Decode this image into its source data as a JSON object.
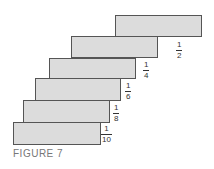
{
  "figure": {
    "caption": "FIGURE 7",
    "blocks": [
      {
        "left": 115,
        "top": 15,
        "width": 87,
        "height": 22,
        "label_num": "1",
        "label_den": "2",
        "label_left": 176,
        "label_top": 41
      },
      {
        "left": 71,
        "top": 36,
        "width": 87,
        "height": 22,
        "label_num": "1",
        "label_den": "4",
        "label_left": 143,
        "label_top": 61
      },
      {
        "left": 49,
        "top": 58,
        "width": 87,
        "height": 21,
        "label_num": "1",
        "label_den": "6",
        "label_left": 125,
        "label_top": 82
      },
      {
        "left": 35,
        "top": 78,
        "width": 86,
        "height": 23,
        "label_num": "1",
        "label_den": "8",
        "label_left": 113,
        "label_top": 104
      },
      {
        "left": 23,
        "top": 100,
        "width": 87,
        "height": 23,
        "label_num": "1",
        "label_den": "10",
        "label_left": 101,
        "label_top": 125
      },
      {
        "left": 13,
        "top": 122,
        "width": 88,
        "height": 23,
        "label_num": "",
        "label_den": "",
        "label_left": 0,
        "label_top": 0
      }
    ],
    "fill_color": "#dcdcdc",
    "border_color": "#555555"
  }
}
